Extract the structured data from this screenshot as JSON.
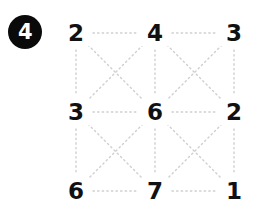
{
  "badge": {
    "label": "4",
    "fill_color": "#0a0a0a",
    "text_color": "#ffffff"
  },
  "puzzle": {
    "grid_rows": 3,
    "grid_cols": 3,
    "line_color": "#cfcfcf",
    "line_style": "dotted",
    "nodes": [
      {
        "id": "r0c0",
        "row": 0,
        "col": 0,
        "value": "2",
        "x": 76,
        "y": 33
      },
      {
        "id": "r0c1",
        "row": 0,
        "col": 1,
        "value": "4",
        "x": 155,
        "y": 33
      },
      {
        "id": "r0c2",
        "row": 0,
        "col": 2,
        "value": "3",
        "x": 234,
        "y": 33
      },
      {
        "id": "r1c0",
        "row": 1,
        "col": 0,
        "value": "3",
        "x": 76,
        "y": 112
      },
      {
        "id": "r1c1",
        "row": 1,
        "col": 1,
        "value": "6",
        "x": 155,
        "y": 112
      },
      {
        "id": "r1c2",
        "row": 1,
        "col": 2,
        "value": "2",
        "x": 234,
        "y": 112
      },
      {
        "id": "r2c0",
        "row": 2,
        "col": 0,
        "value": "6",
        "x": 76,
        "y": 191
      },
      {
        "id": "r2c1",
        "row": 2,
        "col": 1,
        "value": "7",
        "x": 155,
        "y": 191
      },
      {
        "id": "r2c2",
        "row": 2,
        "col": 2,
        "value": "1",
        "x": 234,
        "y": 191
      }
    ],
    "edges": [
      {
        "from": "r0c0",
        "to": "r0c1",
        "kind": "horizontal"
      },
      {
        "from": "r0c1",
        "to": "r0c2",
        "kind": "horizontal"
      },
      {
        "from": "r1c0",
        "to": "r1c1",
        "kind": "horizontal"
      },
      {
        "from": "r1c1",
        "to": "r1c2",
        "kind": "horizontal"
      },
      {
        "from": "r2c0",
        "to": "r2c1",
        "kind": "horizontal"
      },
      {
        "from": "r2c1",
        "to": "r2c2",
        "kind": "horizontal"
      },
      {
        "from": "r0c0",
        "to": "r1c0",
        "kind": "vertical"
      },
      {
        "from": "r1c0",
        "to": "r2c0",
        "kind": "vertical"
      },
      {
        "from": "r0c1",
        "to": "r1c1",
        "kind": "vertical"
      },
      {
        "from": "r1c1",
        "to": "r2c1",
        "kind": "vertical"
      },
      {
        "from": "r0c2",
        "to": "r1c2",
        "kind": "vertical"
      },
      {
        "from": "r1c2",
        "to": "r2c2",
        "kind": "vertical"
      },
      {
        "from": "r0c0",
        "to": "r1c1",
        "kind": "diagonal"
      },
      {
        "from": "r0c1",
        "to": "r1c0",
        "kind": "diagonal"
      },
      {
        "from": "r0c1",
        "to": "r1c2",
        "kind": "diagonal"
      },
      {
        "from": "r0c2",
        "to": "r1c1",
        "kind": "diagonal"
      },
      {
        "from": "r1c0",
        "to": "r2c1",
        "kind": "diagonal"
      },
      {
        "from": "r1c1",
        "to": "r2c0",
        "kind": "diagonal"
      },
      {
        "from": "r1c1",
        "to": "r2c2",
        "kind": "diagonal"
      },
      {
        "from": "r1c2",
        "to": "r2c1",
        "kind": "diagonal"
      }
    ]
  }
}
